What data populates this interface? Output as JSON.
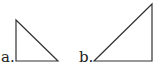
{
  "figures": [
    {
      "label": "a.",
      "shape": "right-triangle",
      "vertices": [
        [
          16,
          20
        ],
        [
          16,
          61
        ],
        [
          58,
          61
        ]
      ]
    },
    {
      "label": "b.",
      "shape": "right-triangle",
      "vertices": [
        [
          94,
          61
        ],
        [
          152,
          61
        ],
        [
          152,
          4
        ]
      ]
    }
  ],
  "style": {
    "stroke": "#333333",
    "background": "#ffffff"
  }
}
